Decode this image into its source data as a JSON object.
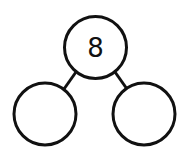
{
  "diagram": {
    "type": "number-bond",
    "whole": {
      "label": "8",
      "cx": 95.5,
      "cy": 47.5,
      "r": 31
    },
    "parts": [
      {
        "label": "",
        "cx": 45,
        "cy": 114,
        "r": 31
      },
      {
        "label": "",
        "cx": 144,
        "cy": 114,
        "r": 31
      }
    ],
    "stroke_color": "#111111",
    "fill_color": "#ffffff"
  }
}
